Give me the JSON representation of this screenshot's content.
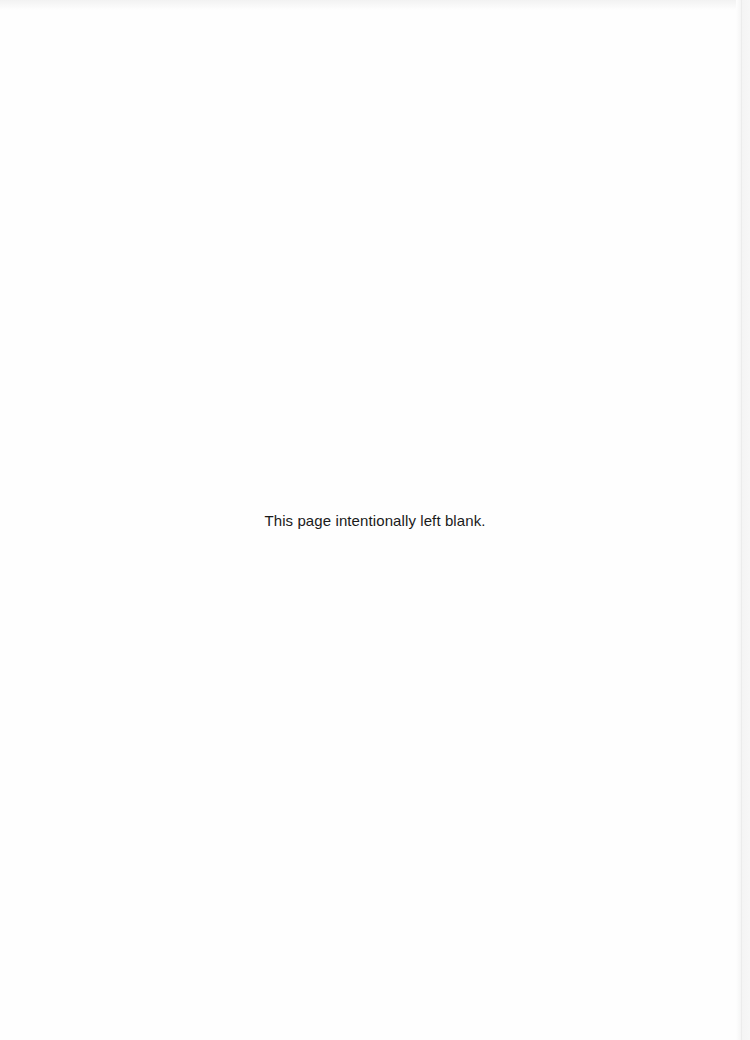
{
  "page": {
    "notice": "This page intentionally left blank."
  }
}
